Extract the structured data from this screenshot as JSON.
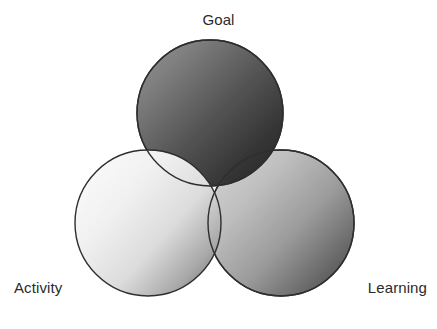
{
  "figure": {
    "type": "venn-diagram",
    "set_count": 3,
    "background_color": "#ffffff",
    "outline_color": "#2e2e2e"
  },
  "labels": {
    "top": "Goal",
    "bottom_left": "Activity",
    "bottom_right": "Learning"
  },
  "chart_data": {
    "type": "venn",
    "title": "",
    "sets": [
      {
        "name": "Goal",
        "label_position": "top",
        "center_x": 210,
        "center_y": 113,
        "radius": 73,
        "fill_light": "#8d8d8d",
        "fill_dark": "#2a2a2a",
        "z_order": 2
      },
      {
        "name": "Activity",
        "label_position": "bottom-left",
        "center_x": 148,
        "center_y": 223,
        "radius": 73,
        "fill_light": "#f4f4f4",
        "fill_dark": "#6f6f6f",
        "z_order": 3
      },
      {
        "name": "Learning",
        "label_position": "bottom-right",
        "center_x": 281,
        "center_y": 223,
        "radius": 73,
        "fill_light": "#c9c9c9",
        "fill_dark": "#3a3a3a",
        "z_order": 1
      }
    ],
    "gradient_direction": "top-left light to bottom-right dark",
    "overlaps": [
      "Goal-Activity",
      "Goal-Learning",
      "Activity-Learning",
      "Goal-Activity-Learning"
    ],
    "legend": "none",
    "grid": false
  }
}
